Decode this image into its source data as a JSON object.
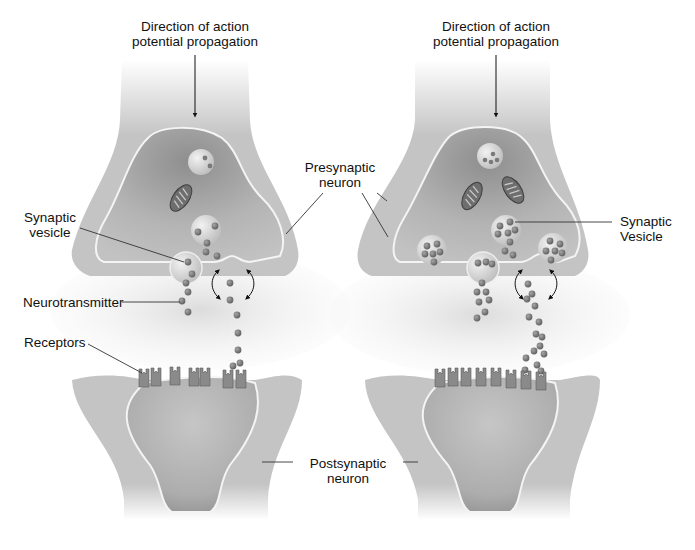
{
  "diagram": {
    "colors": {
      "background": "#ffffff",
      "neuron_body": "#c4c4c4",
      "neuron_inner": "#a9a9a9",
      "membrane": "#f4f4f4",
      "vesicle": "#d8d8d8",
      "neurotransmitter": "#7a7a7a",
      "receptor": "#8a8a8a",
      "mitochondrion": "#6e6e6e",
      "label_line": "#333333",
      "text": "#111111"
    },
    "panels": [
      {
        "id": "left",
        "direction_label": [
          "Direction of action",
          "potential propagation"
        ],
        "receptor_count": 8,
        "vesicle_count": 3,
        "mitochondria_count": 1
      },
      {
        "id": "right",
        "direction_label": [
          "Direction of action",
          "potential propagation"
        ],
        "receptor_count": 8,
        "vesicle_count": 5,
        "mitochondria_count": 2
      }
    ],
    "labels": {
      "direction_left_1": "Direction of action",
      "direction_left_2": "potential propagation",
      "direction_right_1": "Direction of action",
      "direction_right_2": "potential propagation",
      "presynaptic_1": "Presynaptic",
      "presynaptic_2": "neuron",
      "synaptic_vesicle_left_1": "Synaptic",
      "synaptic_vesicle_left_2": "vesicle",
      "synaptic_vesicle_right_1": "Synaptic",
      "synaptic_vesicle_right_2": "Vesicle",
      "neurotransmitter": "Neurotransmitter",
      "receptors": "Receptors",
      "postsynaptic_1": "Postsynaptic",
      "postsynaptic_2": "neuron"
    }
  }
}
